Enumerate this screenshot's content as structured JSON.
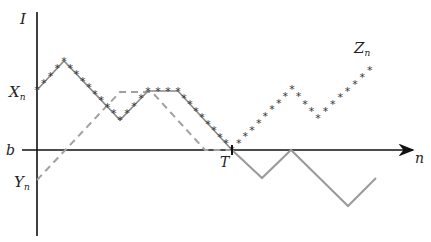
{
  "labels": {
    "y_axis": "I",
    "x_axis": "n",
    "b": "b",
    "X": "X",
    "X_sub": "n",
    "Y": "Y",
    "Y_sub": "n",
    "Z": "Z",
    "Z_sub": "n",
    "T": "T"
  },
  "colors": {
    "axis": "#111111",
    "x_path": "#8a8a8a",
    "star": "#333333",
    "y_path_dashed": "#a0a0a0",
    "y_path_after_T": "#9a9a9a"
  },
  "paths": {
    "X_n": [
      [
        37,
        90
      ],
      [
        64,
        61
      ],
      [
        120,
        120
      ],
      [
        148,
        91
      ],
      [
        178,
        91
      ],
      [
        232,
        150
      ]
    ],
    "Z_n_after_T": [
      [
        232,
        150
      ],
      [
        292,
        89
      ],
      [
        318,
        118
      ],
      [
        377,
        63
      ]
    ],
    "Y_n_dashed": [
      [
        37,
        180
      ],
      [
        120,
        92
      ],
      [
        152,
        92
      ],
      [
        205,
        150
      ],
      [
        232,
        150
      ]
    ],
    "Y_n_after_T": [
      [
        232,
        150
      ],
      [
        262,
        178
      ],
      [
        291,
        150
      ],
      [
        348,
        206
      ],
      [
        376,
        178
      ]
    ]
  }
}
